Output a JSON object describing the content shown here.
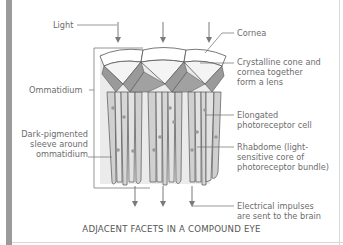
{
  "diagram": {
    "title": "ADJACENT FACETS IN A COMPOUND EYE",
    "labels": {
      "light": "Light",
      "cornea": "Cornea",
      "crystalline_cone": [
        "Crystalline cone and",
        "cornea together",
        "form a lens"
      ],
      "ommatidium": "Ommatidium",
      "photoreceptor": [
        "Elongated",
        "photoreceptor cell"
      ],
      "sleeve": [
        "Dark-pigmented",
        "sleeve around",
        "ommatidium"
      ],
      "rhabdome": [
        "Rhabdome (light-",
        "sensitive core of",
        "photoreceptor bundle)"
      ],
      "impulses": [
        "Electrical impulses",
        "are sent to the brain"
      ]
    },
    "facet_count": 3,
    "colors": {
      "line": "#6d6d6d",
      "text": "#6d6d6d",
      "background_panel": "#e9e9e9",
      "cell_fill": "#d6d6d6",
      "pigment": "#8c8c8c",
      "side_bar": "#9b9b9b"
    }
  }
}
